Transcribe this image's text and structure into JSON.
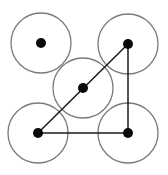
{
  "diagram": {
    "width": 168,
    "height": 175,
    "colors": {
      "background": "#ffffff",
      "circle_stroke": "#7a7a7a",
      "edge": "#1a1a1a",
      "node": "#0a0a0a"
    },
    "circle_radius": 30,
    "node_radius": 5,
    "nodes": [
      {
        "id": "top-left",
        "x": 41,
        "y": 43
      },
      {
        "id": "top-right",
        "x": 128,
        "y": 44
      },
      {
        "id": "center",
        "x": 83,
        "y": 88
      },
      {
        "id": "bottom-left",
        "x": 38,
        "y": 133
      },
      {
        "id": "bottom-right",
        "x": 128,
        "y": 133
      }
    ],
    "edges": [
      {
        "from": "bottom-left",
        "to": "top-right"
      },
      {
        "from": "top-right",
        "to": "bottom-right"
      },
      {
        "from": "bottom-left",
        "to": "bottom-right"
      }
    ]
  }
}
